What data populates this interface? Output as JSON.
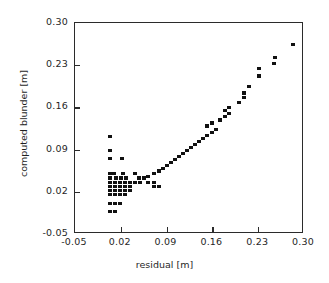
{
  "chart_data": {
    "type": "scatter",
    "title": "",
    "xlabel": "residual [m]",
    "ylabel": "computed blunder [m]",
    "xlim": [
      -0.05,
      0.3
    ],
    "ylim": [
      -0.05,
      0.3
    ],
    "xticks": [
      -0.05,
      0.02,
      0.09,
      0.16,
      0.23,
      0.3
    ],
    "yticks": [
      -0.05,
      0.02,
      0.09,
      0.16,
      0.23,
      0.3
    ],
    "xticklabels": [
      "-0.05",
      "0.02",
      "0.09",
      "0.16",
      "0.23",
      "0.30"
    ],
    "yticklabels": [
      "-0.05",
      "0.02",
      "0.09",
      "0.16",
      "0.23",
      "0.30"
    ],
    "grid": false,
    "legend": false,
    "marker": "square",
    "marker_color": "#111111",
    "series": [
      {
        "name": "computed blunder vs residual",
        "points": [
          [
            0.0035,
            0.1115
          ],
          [
            0.0035,
            0.0885
          ],
          [
            0.0035,
            0.075
          ],
          [
            0.022,
            0.075
          ],
          [
            0.0035,
            0.05
          ],
          [
            0.009,
            0.05
          ],
          [
            0.0235,
            0.05
          ],
          [
            0.042,
            0.05
          ],
          [
            0.0035,
            0.043
          ],
          [
            0.0125,
            0.043
          ],
          [
            0.02,
            0.043
          ],
          [
            0.0275,
            0.043
          ],
          [
            0.048,
            0.043
          ],
          [
            0.056,
            0.043
          ],
          [
            0.0035,
            0.036
          ],
          [
            0.011,
            0.036
          ],
          [
            0.0185,
            0.036
          ],
          [
            0.026,
            0.036
          ],
          [
            0.0335,
            0.036
          ],
          [
            0.042,
            0.036
          ],
          [
            0.05,
            0.036
          ],
          [
            0.062,
            0.036
          ],
          [
            0.07,
            0.036
          ],
          [
            0.0035,
            0.029
          ],
          [
            0.011,
            0.029
          ],
          [
            0.0185,
            0.029
          ],
          [
            0.026,
            0.029
          ],
          [
            0.0335,
            0.029
          ],
          [
            0.07,
            0.029
          ],
          [
            0.078,
            0.029
          ],
          [
            0.0035,
            0.022
          ],
          [
            0.011,
            0.022
          ],
          [
            0.0185,
            0.022
          ],
          [
            0.026,
            0.022
          ],
          [
            0.0335,
            0.022
          ],
          [
            0.0035,
            0.015
          ],
          [
            0.011,
            0.015
          ],
          [
            0.0185,
            0.015
          ],
          [
            0.026,
            0.015
          ],
          [
            0.0035,
            0.001
          ],
          [
            0.011,
            0.001
          ],
          [
            0.0185,
            0.001
          ],
          [
            0.0035,
            -0.013
          ],
          [
            0.011,
            -0.013
          ],
          [
            0.062,
            0.046
          ],
          [
            0.07,
            0.05
          ],
          [
            0.078,
            0.0545
          ],
          [
            0.084,
            0.059
          ],
          [
            0.09,
            0.064
          ],
          [
            0.096,
            0.069
          ],
          [
            0.103,
            0.074
          ],
          [
            0.109,
            0.079
          ],
          [
            0.115,
            0.084
          ],
          [
            0.121,
            0.0885
          ],
          [
            0.128,
            0.093
          ],
          [
            0.134,
            0.098
          ],
          [
            0.14,
            0.103
          ],
          [
            0.146,
            0.108
          ],
          [
            0.152,
            0.113
          ],
          [
            0.159,
            0.118
          ],
          [
            0.165,
            0.124
          ],
          [
            0.152,
            0.129
          ],
          [
            0.159,
            0.134
          ],
          [
            0.171,
            0.139
          ],
          [
            0.179,
            0.145
          ],
          [
            0.186,
            0.15
          ],
          [
            0.179,
            0.1545
          ],
          [
            0.186,
            0.16
          ],
          [
            0.2,
            0.168
          ],
          [
            0.208,
            0.176
          ],
          [
            0.208,
            0.184
          ],
          [
            0.216,
            0.194
          ],
          [
            0.216,
            0.194
          ],
          [
            0.231,
            0.212
          ],
          [
            0.231,
            0.224
          ],
          [
            0.254,
            0.233
          ],
          [
            0.256,
            0.243
          ],
          [
            0.283,
            0.264
          ]
        ]
      }
    ]
  }
}
